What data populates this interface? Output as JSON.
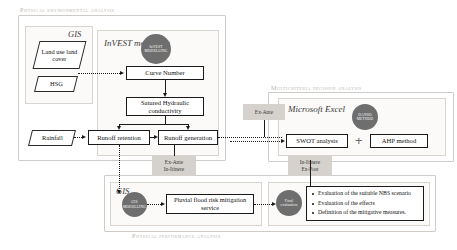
{
  "captions": {
    "top": "Physical environmental analysis",
    "mcda": "Multicriteria decision analysis",
    "bottom": "Physical performance analysis"
  },
  "groups": {
    "gis_top": "GIS",
    "invest": "InVEST modelling",
    "excel": "Microsoft Excel",
    "gis_bottom": "GIS"
  },
  "badges": {
    "invest": "InVEST MODELLING",
    "danso": "DANSO METHOD",
    "gis": "GIS MODELLING",
    "final": "Final evaluation"
  },
  "data_shapes": {
    "land_use": "Land use land cover",
    "hsg": "HSG",
    "rainfall": "Rainfall"
  },
  "process_boxes": {
    "curve_number": "Curve Number",
    "saturated_hydraulic": "Satured Hydraulic conductivity",
    "runoff_retention": "Runoff retention",
    "runoff_generation": "Runoff generation",
    "swot": "SWOT analysis",
    "ahp": "AHP method",
    "pluvial": "Pluvial flood risk mitigation service"
  },
  "phases": {
    "ex_ante": "Ex-Ante",
    "ante_itinere": "Ex-Ante\nIn-Itinere",
    "itinere_post": "In-Itinere\nEx-Post"
  },
  "evaluation_bullets": [
    "Evaluation of the suitable NBS scenario",
    "Evaluation of the effects",
    "Definition of the mitigative measures."
  ],
  "operators": {
    "plus": "+"
  },
  "colors": {
    "badge_fill": "#6e6e6e",
    "phase_fill": "#d5d2ce",
    "caption_text": "#b9b5b0",
    "stroke": "#1a1a1a"
  }
}
